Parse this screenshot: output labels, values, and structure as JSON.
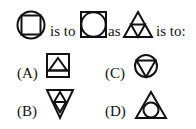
{
  "question": {
    "figure1": "circle-with-inscribed-square",
    "text1": "is to",
    "figure2": "square-with-inscribed-circle",
    "text2": "as",
    "figure3": "triangle-subdivided-into-four",
    "text3": "is to:"
  },
  "options": [
    {
      "label": "(A)",
      "figure": "square-with-triangle-and-base-line"
    },
    {
      "label": "(B)",
      "figure": "inverted-triangle-with-inner-triangle-and-diamond"
    },
    {
      "label": "(C)",
      "figure": "circle-with-inscribed-inverted-triangle"
    },
    {
      "label": "(D)",
      "figure": "triangle-with-inscribed-circle"
    }
  ],
  "colors": {
    "stroke": "#111111",
    "background": "#ffffff"
  }
}
